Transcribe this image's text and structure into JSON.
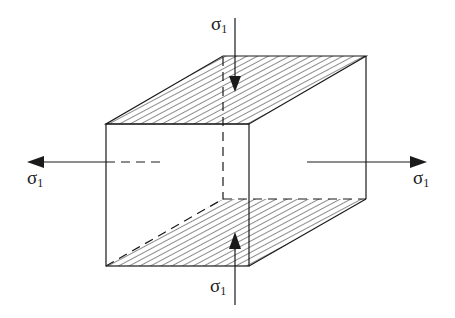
{
  "diagram": {
    "title": "",
    "labels": {
      "top": {
        "symbol": "σ",
        "subscript": "1"
      },
      "bottom": {
        "symbol": "σ",
        "subscript": "1"
      },
      "left": {
        "symbol": "σ",
        "subscript": "1"
      },
      "right": {
        "symbol": "σ",
        "subscript": "1"
      }
    },
    "arrows": [
      {
        "id": "top",
        "direction": "down",
        "label": "σ1"
      },
      {
        "id": "bottom",
        "direction": "up",
        "label": "σ1"
      },
      {
        "id": "left",
        "direction": "left",
        "label": "σ1"
      },
      {
        "id": "right",
        "direction": "right",
        "label": "σ1"
      }
    ],
    "faces": {
      "top": "hatched",
      "bottom": "hatched"
    },
    "colors": {
      "stroke": "#1a1a1a",
      "background": "#ffffff"
    }
  }
}
